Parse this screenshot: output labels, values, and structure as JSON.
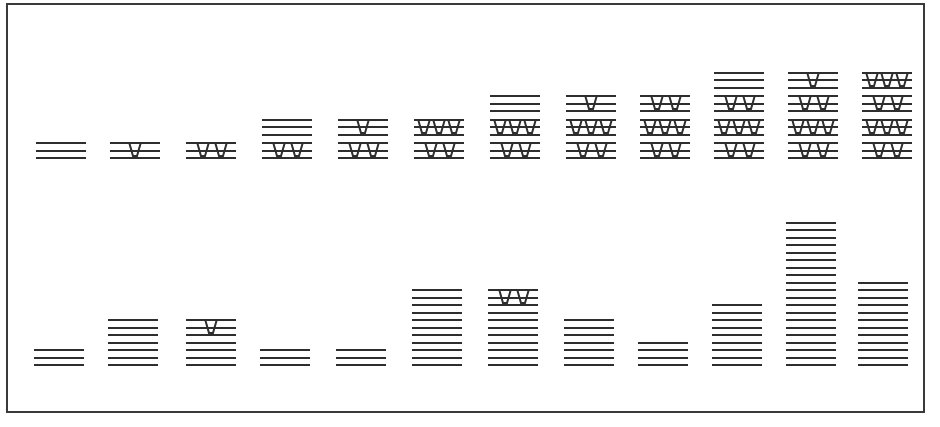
{
  "diagram": {
    "frame": {
      "stroke": "#3a3a3a"
    },
    "ink_color": "#2e2e2e",
    "line_spacing_px": 7.5,
    "group_gap_px": 1,
    "top_row": {
      "baseline_y": 157,
      "columns": [
        {
          "x": 36,
          "groups": [
            0
          ]
        },
        {
          "x": 110,
          "groups": [
            1
          ]
        },
        {
          "x": 186,
          "groups": [
            2
          ]
        },
        {
          "x": 262,
          "groups": [
            2,
            0
          ]
        },
        {
          "x": 338,
          "groups": [
            2,
            1
          ]
        },
        {
          "x": 414,
          "groups": [
            2,
            3
          ]
        },
        {
          "x": 490,
          "groups": [
            2,
            3,
            0
          ]
        },
        {
          "x": 566,
          "groups": [
            2,
            3,
            1
          ]
        },
        {
          "x": 640,
          "groups": [
            2,
            3,
            2
          ]
        },
        {
          "x": 714,
          "groups": [
            2,
            3,
            2,
            0
          ]
        },
        {
          "x": 788,
          "groups": [
            2,
            3,
            2,
            1
          ]
        },
        {
          "x": 862,
          "groups": [
            2,
            3,
            2,
            3
          ]
        }
      ]
    },
    "bottom_row": {
      "baseline_y": 364,
      "columns": [
        {
          "x": 34,
          "lines": 3,
          "top_notches": 0
        },
        {
          "x": 108,
          "lines": 7,
          "top_notches": 0
        },
        {
          "x": 186,
          "lines": 7,
          "top_notches": 1
        },
        {
          "x": 260,
          "lines": 3,
          "top_notches": 0
        },
        {
          "x": 336,
          "lines": 3,
          "top_notches": 0
        },
        {
          "x": 412,
          "lines": 11,
          "top_notches": 0
        },
        {
          "x": 488,
          "lines": 11,
          "top_notches": 2
        },
        {
          "x": 564,
          "lines": 7,
          "top_notches": 0
        },
        {
          "x": 638,
          "lines": 4,
          "top_notches": 0
        },
        {
          "x": 712,
          "lines": 9,
          "top_notches": 0
        },
        {
          "x": 786,
          "lines": 20,
          "top_notches": 0
        },
        {
          "x": 858,
          "lines": 12,
          "top_notches": 0
        }
      ]
    }
  }
}
